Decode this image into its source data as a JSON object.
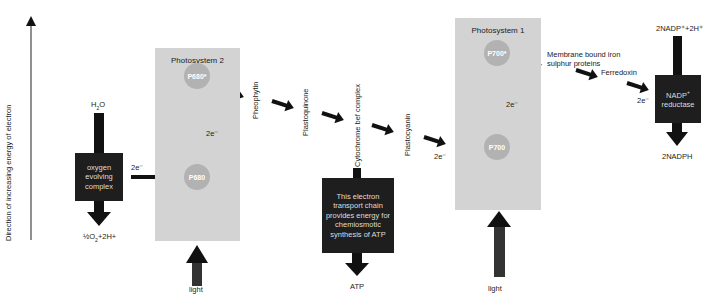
{
  "axis": {
    "label": "Direction of increasing energy of electron"
  },
  "water_input": {
    "label_main": "H",
    "label_sub": "2",
    "label_tail": "O"
  },
  "oxygen_complex": {
    "label": "oxygen evolving complex",
    "output_main": "½O",
    "output_sub": "2",
    "output_tail": "+2H+"
  },
  "electron_labels": {
    "oec_to_p680": "2e⁻",
    "ps2_internal": "2e⁻",
    "to_ps1": "2e⁻",
    "ps1_internal": "2e⁻",
    "to_nadp": "2e⁻"
  },
  "photosystem2": {
    "title": "Photosystem 2",
    "ground": "P680",
    "excited": "P680*",
    "light": "light"
  },
  "carriers": [
    "Pheophytin",
    "Plastoquinone",
    "Cytochrome bef complex",
    "Plastocyanin"
  ],
  "atp_box": {
    "label": "This electron transport chain provides energy for chemiosmotic synthesis of ATP",
    "output": "ATP"
  },
  "photosystem1": {
    "title": "Photosystem 1",
    "ground": "P700",
    "excited": "P700*",
    "light": "light"
  },
  "fes_proteins": {
    "label": "Membrane bound iron sulphur proteins"
  },
  "ferredoxin": {
    "label": "Ferredoxin"
  },
  "nadp_reductase": {
    "label_main": "NADP",
    "label_sup": "+",
    "label_tail": "reductase",
    "input": "2NADP⁺+2H⁺",
    "output": "2NADPH"
  },
  "colors": {
    "panel": "#d3d3d3",
    "circle": "#b2b2b2",
    "box": "#1e1e1e",
    "arrow": "#111111"
  }
}
